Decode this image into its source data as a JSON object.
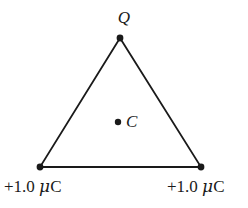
{
  "figure": {
    "background_color": "#ffffff",
    "stroke_color": "#1a1a1a",
    "width": 248,
    "height": 208
  },
  "labels": {
    "apex_charge": "Q",
    "center_point": "C",
    "left_charge_sign_value": "+1.0",
    "left_charge_mu": "μ",
    "left_charge_unit": "C",
    "right_charge_sign_value": "+1.0",
    "right_charge_mu": "μ",
    "right_charge_unit": "C",
    "left_charge_full": "+1.0 μC",
    "right_charge_full": "+1.0 μC"
  },
  "geometry": {
    "apex": {
      "x": 120,
      "y": 38
    },
    "bottom_left": {
      "x": 40,
      "y": 167
    },
    "bottom_right": {
      "x": 201,
      "y": 167
    },
    "centroid": {
      "x": 118,
      "y": 122
    },
    "vertex_dot_radius": 3.4,
    "center_dot_radius": 3.2,
    "line_width": 1.8,
    "triangle_points": "120,38 40,167 201,167"
  }
}
